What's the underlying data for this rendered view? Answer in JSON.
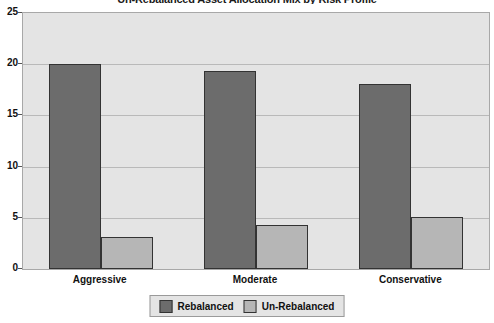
{
  "chart_data": {
    "type": "bar",
    "title": "Un-Rebalanced Asset Allocation Mix by Risk Profile",
    "xlabel": "",
    "ylabel": "",
    "categories": [
      "Aggressive",
      "Moderate",
      "Conservative"
    ],
    "series": [
      {
        "name": "Rebalanced",
        "color": "#6c6c6c",
        "values": [
          20.0,
          19.3,
          18.1
        ]
      },
      {
        "name": "Un-Rebalanced",
        "color": "#b6b6b6",
        "values": [
          3.1,
          4.3,
          5.1
        ]
      }
    ],
    "ylim": [
      0,
      25
    ],
    "yticks": [
      0,
      5,
      10,
      15,
      20,
      25
    ],
    "ytick_labels": [
      "0",
      "5",
      "10",
      "15",
      "20",
      "25"
    ],
    "grid": true,
    "grid_axis": "y",
    "legend_position": "bottom-center",
    "plot_background": "#e4e4e4",
    "page_background": "#ffffff"
  }
}
